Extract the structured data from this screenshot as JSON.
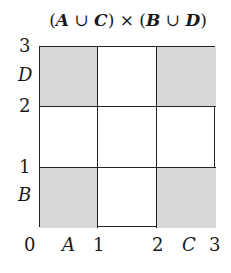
{
  "title": {
    "open1": "(",
    "a": "A",
    "union1": " ∪ ",
    "c": "C",
    "close1": ")",
    "times": " × ",
    "open2": "(",
    "b": "B",
    "union2": " ∪ ",
    "d": "D",
    "close2": ")"
  },
  "x_axis": {
    "ticks": [
      "0",
      "1",
      "2",
      "3"
    ],
    "set_labels": [
      "A",
      "C"
    ]
  },
  "y_axis": {
    "ticks": [
      "1",
      "2",
      "3"
    ],
    "set_labels": [
      "B",
      "D"
    ]
  },
  "grid": {
    "rows": 3,
    "cols": 3,
    "shaded_cells": [
      [
        0,
        0
      ],
      [
        0,
        2
      ],
      [
        2,
        0
      ],
      [
        2,
        2
      ]
    ],
    "shade_color": "#d8d8d8",
    "line_color": "#222222"
  }
}
